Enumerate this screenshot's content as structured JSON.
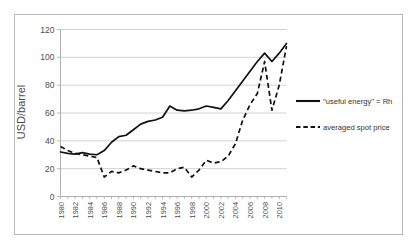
{
  "figure": {
    "background_color": "#ffffff",
    "frame_color": "#b9b9b9",
    "grid_color": "#c6c6c6",
    "axis_color": "#a8a8a8",
    "line_color": "#111111"
  },
  "axes": {
    "ylabel": "USD/barrel",
    "yticks": [
      "0",
      "20",
      "40",
      "60",
      "80",
      "100",
      "120"
    ],
    "xticks": [
      "1980",
      "1982",
      "1984",
      "1986",
      "1988",
      "1990",
      "1992",
      "1994",
      "1996",
      "1998",
      "2000",
      "2002",
      "2004",
      "2006",
      "2008",
      "2010"
    ]
  },
  "legend": {
    "entries": [
      {
        "label": "\"useful energy\" = Rh",
        "style": "solid"
      },
      {
        "label": "averaged spot price",
        "style": "dashed"
      }
    ]
  },
  "chart_data": {
    "type": "line",
    "title": "",
    "xlabel": "",
    "ylabel": "USD/barrel",
    "xlim": [
      1980,
      2011
    ],
    "ylim": [
      0,
      120
    ],
    "ytick_values": [
      0,
      20,
      40,
      60,
      80,
      100,
      120
    ],
    "xtick_values": [
      1980,
      1982,
      1984,
      1986,
      1988,
      1990,
      1992,
      1994,
      1996,
      1998,
      2000,
      2002,
      2004,
      2006,
      2008,
      2010
    ],
    "grid": "horizontal",
    "legend_position": "right",
    "x": [
      1980,
      1981,
      1982,
      1983,
      1984,
      1985,
      1986,
      1987,
      1988,
      1989,
      1990,
      1991,
      1992,
      1993,
      1994,
      1995,
      1996,
      1997,
      1998,
      1999,
      2000,
      2001,
      2002,
      2003,
      2004,
      2005,
      2006,
      2007,
      2008,
      2009,
      2010,
      2011
    ],
    "series": [
      {
        "name": "\"useful energy\" = Rh",
        "style": "solid",
        "values": [
          32,
          31,
          30.5,
          31.5,
          30.5,
          30,
          33,
          39,
          43,
          44,
          48,
          52,
          54,
          55,
          57,
          65,
          62,
          61.5,
          62,
          63,
          65,
          64,
          63,
          69,
          76,
          83,
          90,
          97,
          103,
          97,
          103,
          110
        ]
      },
      {
        "name": "averaged spot price",
        "style": "dashed",
        "values": [
          36,
          33,
          31,
          30,
          29,
          28,
          14,
          18,
          17,
          19,
          22,
          20,
          19,
          18,
          17,
          17,
          20,
          21,
          14,
          19,
          26,
          24,
          25,
          29,
          38,
          55,
          66,
          74,
          97,
          62,
          80,
          108
        ]
      }
    ]
  }
}
